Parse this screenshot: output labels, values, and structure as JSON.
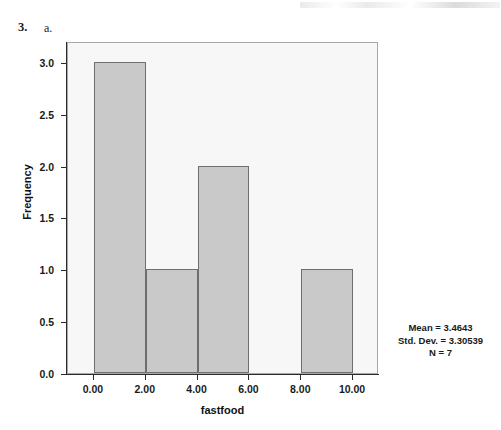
{
  "page": {
    "question_number": "3.",
    "question_part": "a."
  },
  "chart_data": {
    "type": "bar",
    "title": "",
    "subtitle": "",
    "xlabel": "fastfood",
    "ylabel": "Frequency",
    "xlim": [
      -1.0,
      11.0
    ],
    "ylim": [
      0.0,
      3.2
    ],
    "grid": false,
    "legend": "none",
    "x_tick_labels": [
      "0.00",
      "2.00",
      "4.00",
      "6.00",
      "8.00",
      "10.00"
    ],
    "x_tick_values": [
      0,
      2,
      4,
      6,
      8,
      10
    ],
    "y_tick_labels": [
      "0.0",
      "0.5",
      "1.0",
      "1.5",
      "2.0",
      "2.5",
      "3.0"
    ],
    "y_tick_values": [
      0.0,
      0.5,
      1.0,
      1.5,
      2.0,
      2.5,
      3.0
    ],
    "bin_width": 2,
    "bins": [
      {
        "label": "0.00-2.00",
        "x_start": 0,
        "x_end": 2,
        "value": 3
      },
      {
        "label": "2.00-4.00",
        "x_start": 2,
        "x_end": 4,
        "value": 1
      },
      {
        "label": "4.00-6.00",
        "x_start": 4,
        "x_end": 6,
        "value": 2
      },
      {
        "label": "6.00-8.00",
        "x_start": 6,
        "x_end": 8,
        "value": 0
      },
      {
        "label": "8.00-10.00",
        "x_start": 8,
        "x_end": 10,
        "value": 1
      }
    ],
    "categories": [
      "0.00-2.00",
      "2.00-4.00",
      "4.00-6.00",
      "6.00-8.00",
      "8.00-10.00"
    ],
    "values": [
      3,
      1,
      2,
      0,
      1
    ],
    "colors": {
      "bar_fill": "#c9c9c9",
      "bar_border": "#6e6e6e",
      "panel_background": "#f7f7f7",
      "panel_border": "#a8a8a8",
      "axis": "#2b2b2b",
      "text": "#1a1a1a"
    },
    "annotations": {
      "mean": "Mean = 3.4643",
      "std_dev": "Std. Dev. = 3.30539",
      "n": "N = 7"
    }
  }
}
